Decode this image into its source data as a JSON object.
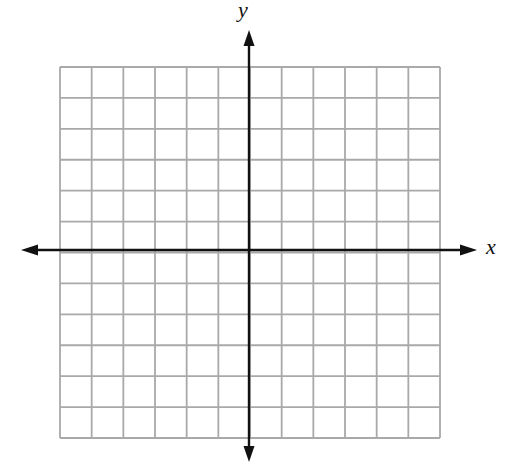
{
  "diagram": {
    "type": "coordinate-plane",
    "axes": {
      "x_label": "x",
      "y_label": "y",
      "arrows": [
        "up",
        "down",
        "left",
        "right"
      ]
    },
    "grid": {
      "columns": 12,
      "rows": 12,
      "left_px": 60,
      "right_px": 440,
      "top_px": 67,
      "bottom_px": 438,
      "origin_column_index": 6,
      "origin_row_index": 6
    },
    "colors": {
      "grid_line": "#a9a9a9",
      "axis": "#111111",
      "background": "#ffffff"
    }
  }
}
